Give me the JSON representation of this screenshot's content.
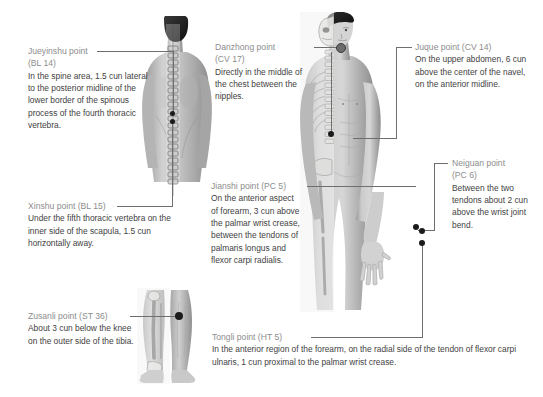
{
  "page": {
    "kind": "acupuncture-point-reference-chart",
    "background_color": "#ffffff",
    "title_color": "#8d8d8d",
    "body_color": "#3f3f3f",
    "leader_color": "#6e6e6e",
    "dot_color": "#1b1b1b"
  },
  "callouts": [
    {
      "id": "jueyinshu",
      "title": "Jueyinshu point",
      "subtitle": "(BL 14)",
      "body": "In the spine area, 1.5 cun lateral to the posterior midline of the lower border of the spinous process of the fourth thoracic vertebra."
    },
    {
      "id": "xinshu",
      "title": "Xinshu point (BL 15)",
      "subtitle": "",
      "body": "Under the fifth thoracic vertebra on the inner side of the scapula, 1.5 cun horizontally away."
    },
    {
      "id": "zusanli",
      "title": "Zusanli point (ST 36)",
      "subtitle": "",
      "body": "About 3 cun below the knee on the outer side of the tibia."
    },
    {
      "id": "danzhong",
      "title": "Danzhong point",
      "subtitle": "(CV 17)",
      "body": "Directly in the middle of the chest between the nipples."
    },
    {
      "id": "jianshi",
      "title": "Jianshi point (PC 5)",
      "subtitle": "",
      "body": "On the anterior aspect of forearm, 3 cun above the palmar wrist crease, between the tendons of palmaris longus and flexor carpi radialis."
    },
    {
      "id": "juque",
      "title": "Juque point (CV 14)",
      "subtitle": "",
      "body": "On the upper abdomen, 6 cun above the center of the navel, on the anterior midline."
    },
    {
      "id": "neiguan",
      "title": "Neiguan point",
      "subtitle": "(PC 6)",
      "body": "Between the two tendons about 2 cun above the wrist joint bend."
    },
    {
      "id": "tongli",
      "title": "Tongli point (HT 5)",
      "subtitle": "",
      "body": "In the anterior region of the forearm, on the radial side of the tendon of flexor carpi ulnaris, 1 cun proximal to the palmar wrist crease."
    }
  ],
  "figures": [
    {
      "id": "back-torso",
      "label": "posterior upper body with spinal column overlay"
    },
    {
      "id": "front-body",
      "label": "anterior male body, half skeletal anatomical overlay"
    },
    {
      "id": "legs",
      "label": "lower legs, half skeletal anatomical overlay"
    }
  ]
}
